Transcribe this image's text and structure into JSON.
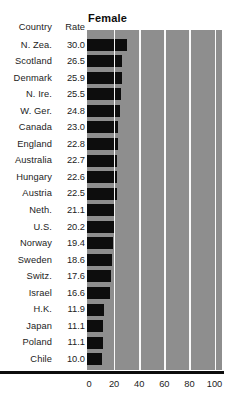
{
  "table": {
    "headers": {
      "country": "Country",
      "rate": "Rate"
    },
    "rows": [
      {
        "country": "N. Zea.",
        "rate": "30.0"
      },
      {
        "country": "Scotland",
        "rate": "26.5"
      },
      {
        "country": "Denmark",
        "rate": "25.9"
      },
      {
        "country": "N. Ire.",
        "rate": "25.5"
      },
      {
        "country": "W. Ger.",
        "rate": "24.8"
      },
      {
        "country": "Canada",
        "rate": "23.0"
      },
      {
        "country": "England",
        "rate": "22.8"
      },
      {
        "country": "Australia",
        "rate": "22.7"
      },
      {
        "country": "Hungary",
        "rate": "22.6"
      },
      {
        "country": "Austria",
        "rate": "22.5"
      },
      {
        "country": "Neth.",
        "rate": "21.1"
      },
      {
        "country": "U.S.",
        "rate": "20.2"
      },
      {
        "country": "Norway",
        "rate": "19.4"
      },
      {
        "country": "Sweden",
        "rate": "18.6"
      },
      {
        "country": "Switz.",
        "rate": "17.6"
      },
      {
        "country": "Israel",
        "rate": "16.6"
      },
      {
        "country": "H.K.",
        "rate": "11.9"
      },
      {
        "country": "Japan",
        "rate": "11.1"
      },
      {
        "country": "Poland",
        "rate": "11.1"
      },
      {
        "country": "Chile",
        "rate": "10.0"
      }
    ]
  },
  "colors": {
    "bar": "#0d0d0d",
    "plot_background": "#8e8e8e",
    "gridline": "#fafafa",
    "axis": "#0d0d0d",
    "text": "#1c1c1c"
  },
  "chart_data": {
    "type": "bar",
    "orientation": "horizontal",
    "title": "Female",
    "xlabel": "",
    "ylabel": "",
    "xlim": [
      0,
      100
    ],
    "xticks": [
      0,
      20,
      40,
      60,
      80,
      100
    ],
    "xtick_labels": [
      "0",
      "20",
      "40",
      "60",
      "80",
      "100"
    ],
    "grid": true,
    "grid_axis": "x",
    "legend": false,
    "categories": [
      "N. Zea.",
      "Scotland",
      "Denmark",
      "N. Ire.",
      "W. Ger.",
      "Canada",
      "England",
      "Australia",
      "Hungary",
      "Austria",
      "Neth.",
      "U.S.",
      "Norway",
      "Sweden",
      "Switz.",
      "Israel",
      "H.K.",
      "Japan",
      "Poland",
      "Chile"
    ],
    "values": [
      30.0,
      26.5,
      25.9,
      25.5,
      24.8,
      23.0,
      22.8,
      22.7,
      22.6,
      22.5,
      21.1,
      20.2,
      19.4,
      18.6,
      17.6,
      16.6,
      11.9,
      11.1,
      11.1,
      10.0
    ]
  }
}
